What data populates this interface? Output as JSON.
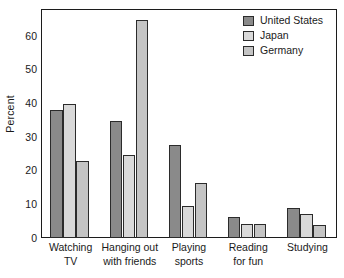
{
  "chart_data": {
    "type": "bar",
    "title": "",
    "xlabel": "",
    "ylabel": "Percent",
    "ylim": [
      0,
      68
    ],
    "yticks": [
      0,
      10,
      20,
      30,
      40,
      50,
      60
    ],
    "ytick_labels": [
      "0",
      "10",
      "20",
      "30",
      "40",
      "50",
      "60"
    ],
    "grid": false,
    "legend_position": "top-right",
    "categories": [
      "Watching TV",
      "Hanging out with friends",
      "Playing sports",
      "Reading for fun",
      "Studying"
    ],
    "category_lines": [
      [
        "Watching",
        "TV"
      ],
      [
        "Hanging out",
        "with friends"
      ],
      [
        "Playing",
        "sports"
      ],
      [
        "Reading",
        "for fun"
      ],
      [
        "Studying",
        ""
      ]
    ],
    "series": [
      {
        "name": "United States",
        "color": "#8a8a8a",
        "values": [
          38.0,
          34.7,
          27.5,
          6.2,
          9.0
        ]
      },
      {
        "name": "Japan",
        "color": "#d9d9d9",
        "values": [
          39.9,
          24.6,
          9.4,
          4.3,
          7.0
        ]
      },
      {
        "name": "Germany",
        "color": "#c4c4c4",
        "values": [
          22.9,
          64.6,
          16.3,
          4.3,
          4.0
        ]
      }
    ]
  },
  "legend": {
    "items": [
      {
        "label": "United States",
        "color": "#8a8a8a"
      },
      {
        "label": "Japan",
        "color": "#d9d9d9"
      },
      {
        "label": "Germany",
        "color": "#c4c4c4"
      }
    ]
  },
  "axis": {
    "y_title": "Percent"
  }
}
